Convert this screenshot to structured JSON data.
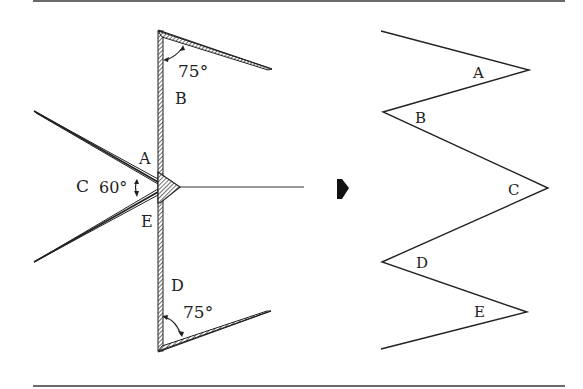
{
  "figure": {
    "left_panel": {
      "description": "Folded strip with hinge joints",
      "labels": {
        "A": "A",
        "B": "B",
        "C": "C",
        "D": "D",
        "E": "E"
      },
      "angles": {
        "top": "75°",
        "middle": "60°",
        "bottom": "75°"
      }
    },
    "arrow": {
      "icon": "right-arrow-icon"
    },
    "right_panel": {
      "description": "Unfolded zigzag",
      "labels": {
        "A": "A",
        "B": "B",
        "C": "C",
        "D": "D",
        "E": "E"
      }
    }
  }
}
